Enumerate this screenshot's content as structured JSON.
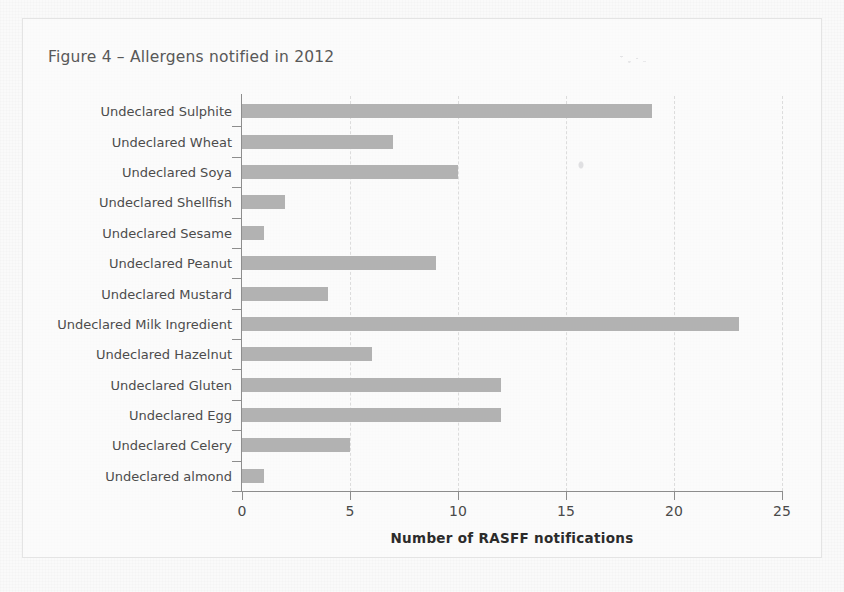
{
  "figure": {
    "title": "Figure 4 – Allergens notified in 2012",
    "border_color": "#e4e4e4",
    "background_color": "#fafafa"
  },
  "chart_data": {
    "type": "bar",
    "orientation": "horizontal",
    "title": "Figure 4 – Allergens notified in 2012",
    "xlabel": "Number of RASFF notifications",
    "ylabel": "",
    "xlim": [
      0,
      25
    ],
    "xticks": [
      0,
      5,
      10,
      15,
      20,
      25
    ],
    "xtick_labels": [
      "0",
      "5",
      "10",
      "15",
      "20",
      "25"
    ],
    "grid": "vertical-dashed",
    "legend": "none",
    "bar_color": "#b2b2b2",
    "categories": [
      "Undeclared Sulphite",
      "Undeclared Wheat",
      "Undeclared Soya",
      "Undeclared Shellfish",
      "Undeclared Sesame",
      "Undeclared Peanut",
      "Undeclared Mustard",
      "Undeclared Milk Ingredient",
      "Undeclared Hazelnut",
      "Undeclared Gluten",
      "Undeclared Egg",
      "Undeclared Celery",
      "Undeclared almond"
    ],
    "values": [
      19,
      7,
      10,
      2,
      1,
      9,
      4,
      23,
      6,
      12,
      12,
      5,
      1
    ]
  }
}
